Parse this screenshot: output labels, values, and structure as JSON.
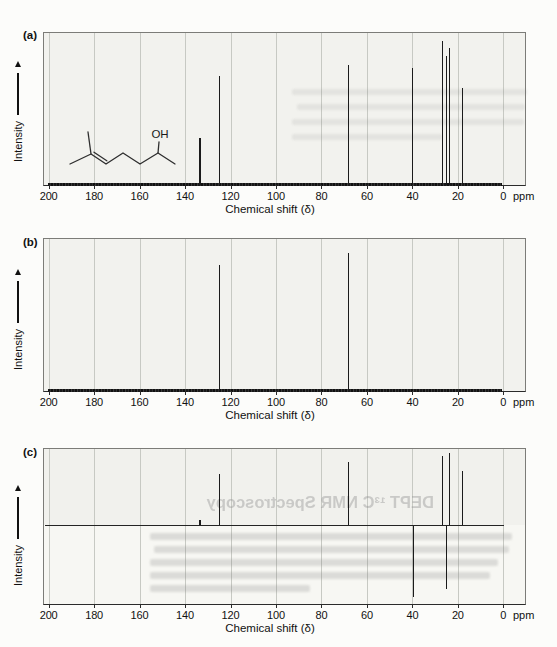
{
  "chart_data": [
    {
      "panel": "(a)",
      "type": "line",
      "variant": "stick-nmr-spectrum",
      "ylabel": "Intensity",
      "xlabel": "Chemical shift (δ)",
      "x_unit": "ppm",
      "xlim": [
        200,
        0
      ],
      "x_ticks": [
        200,
        180,
        160,
        140,
        120,
        100,
        80,
        60,
        40,
        20,
        0
      ],
      "grid": true,
      "molecule": {
        "hydroxyl_label": "OH"
      },
      "peaks": [
        {
          "ppm": 133.4,
          "rel": 0.31
        },
        {
          "ppm": 124.8,
          "rel": 0.72
        },
        {
          "ppm": 68.2,
          "rel": 0.79
        },
        {
          "ppm": 39.8,
          "rel": 0.77
        },
        {
          "ppm": 26.6,
          "rel": 0.95
        },
        {
          "ppm": 24.9,
          "rel": 0.85
        },
        {
          "ppm": 23.6,
          "rel": 0.9
        },
        {
          "ppm": 17.9,
          "rel": 0.64
        }
      ]
    },
    {
      "panel": "(b)",
      "type": "line",
      "variant": "stick-nmr-spectrum",
      "ylabel": "Intensity",
      "xlabel": "Chemical shift (δ)",
      "x_unit": "ppm",
      "xlim": [
        200,
        0
      ],
      "x_ticks": [
        200,
        180,
        160,
        140,
        120,
        100,
        80,
        60,
        40,
        20,
        0
      ],
      "grid": true,
      "peaks": [
        {
          "ppm": 124.8,
          "rel": 0.83
        },
        {
          "ppm": 68.2,
          "rel": 0.91
        }
      ]
    },
    {
      "panel": "(c)",
      "type": "line",
      "variant": "stick-nmr-spectrum-updown",
      "ylabel": "Intensity",
      "xlabel": "Chemical shift (δ)",
      "x_unit": "ppm",
      "xlim": [
        200,
        0
      ],
      "x_ticks": [
        200,
        180,
        160,
        140,
        120,
        100,
        80,
        60,
        40,
        20,
        0
      ],
      "grid": true,
      "peaks": [
        {
          "ppm": 133.4,
          "rel": 0.07
        },
        {
          "ppm": 124.8,
          "rel": 0.65
        },
        {
          "ppm": 68.2,
          "rel": 0.81
        },
        {
          "ppm": 26.6,
          "rel": 0.88
        },
        {
          "ppm": 23.7,
          "rel": 0.92
        },
        {
          "ppm": 17.9,
          "rel": 0.69
        },
        {
          "ppm": 39.6,
          "rel": -0.9
        },
        {
          "ppm": 24.9,
          "rel": -0.79
        }
      ],
      "ghost_text": {
        "heading": "DEPT ¹³C NMR Spectroscopy"
      }
    }
  ]
}
